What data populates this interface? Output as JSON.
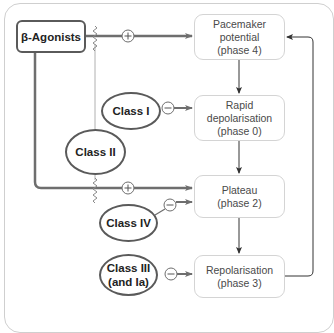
{
  "diagram": {
    "drug_source": {
      "label": "β-Agonists"
    },
    "phases": [
      {
        "id": "phase4",
        "lines": [
          "Pacemaker",
          "potential",
          "(phase 4)"
        ]
      },
      {
        "id": "phase0",
        "lines": [
          "Rapid",
          "depolarisation",
          "(phase 0)"
        ]
      },
      {
        "id": "phase2",
        "lines": [
          "Plateau",
          "(phase 2)"
        ]
      },
      {
        "id": "phase3",
        "lines": [
          "Repolarisation",
          "(phase 3)"
        ]
      }
    ],
    "drug_classes": [
      {
        "id": "class1",
        "lines": [
          "Class I"
        ],
        "effect": "−",
        "target": "phase0"
      },
      {
        "id": "class2",
        "lines": [
          "Class II"
        ],
        "effect": "blocks β-agonist",
        "target": "phase4,phase2"
      },
      {
        "id": "class4",
        "lines": [
          "Class IV"
        ],
        "effect": "−",
        "target": "phase2"
      },
      {
        "id": "class3",
        "lines": [
          "Class III",
          "(and Ia)"
        ],
        "effect": "−",
        "target": "phase3"
      }
    ],
    "symbols": {
      "plus": "+",
      "minus": "−"
    },
    "colors": {
      "thick_line": "#6e6e6e",
      "thin_line": "#9a9a9a",
      "box_border": "#d4d4d4",
      "oval_border": "#5a5a5a",
      "arrow_dark": "#333333"
    }
  }
}
